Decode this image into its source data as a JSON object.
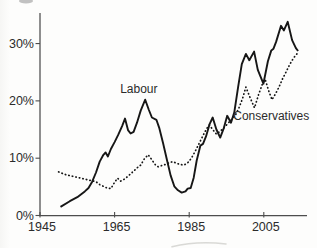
{
  "chart_data": {
    "type": "line",
    "title": "",
    "xlabel": "",
    "ylabel": "",
    "grid": false,
    "legend_position": "inline-labels",
    "x_axis": {
      "min": 1945,
      "max": 2016.5,
      "ticks": [
        {
          "label": "1945",
          "value": 1945
        },
        {
          "label": "1965",
          "value": 1965
        },
        {
          "label": "1985",
          "value": 1985
        },
        {
          "label": "2005",
          "value": 2005
        }
      ]
    },
    "y_axis": {
      "min": 0,
      "max": 35.3,
      "unit": "%",
      "ticks": [
        {
          "label": "0%",
          "value": 0
        },
        {
          "label": "10%",
          "value": 10
        },
        {
          "label": "20%",
          "value": 20
        },
        {
          "label": "30%",
          "value": 30
        }
      ]
    },
    "colors": {
      "line": "#161616",
      "axis": "#4d4d4d",
      "text": "#2b2b2b",
      "background": "#fdfdfc"
    },
    "series": [
      {
        "name": "Labour",
        "line_style": "solid",
        "points": [
          [
            1950.5,
            1.5
          ],
          [
            1953,
            2.5
          ],
          [
            1955,
            3.2
          ],
          [
            1957,
            4.2
          ],
          [
            1958,
            4.8
          ],
          [
            1959,
            5.9
          ],
          [
            1960,
            7.5
          ],
          [
            1961,
            9.4
          ],
          [
            1962,
            10.6
          ],
          [
            1962.6,
            11.0
          ],
          [
            1963.2,
            10.3
          ],
          [
            1964,
            11.6
          ],
          [
            1965,
            12.8
          ],
          [
            1966,
            14.1
          ],
          [
            1967,
            15.6
          ],
          [
            1967.8,
            16.9
          ],
          [
            1968.6,
            14.9
          ],
          [
            1969.3,
            14.3
          ],
          [
            1970.1,
            14.6
          ],
          [
            1971,
            16.2
          ],
          [
            1972,
            18.3
          ],
          [
            1973.2,
            20.2
          ],
          [
            1974.2,
            18.4
          ],
          [
            1975,
            17.1
          ],
          [
            1976.2,
            16.7
          ],
          [
            1977,
            15.2
          ],
          [
            1978,
            12.6
          ],
          [
            1979,
            9.8
          ],
          [
            1980,
            7.0
          ],
          [
            1981,
            5.1
          ],
          [
            1982,
            4.4
          ],
          [
            1983,
            4.0
          ],
          [
            1984,
            4.2
          ],
          [
            1984.6,
            4.7
          ],
          [
            1985.4,
            4.8
          ],
          [
            1986.2,
            6.6
          ],
          [
            1987,
            9.6
          ],
          [
            1988,
            12.2
          ],
          [
            1988.7,
            12.5
          ],
          [
            1989.5,
            13.8
          ],
          [
            1990.5,
            16.0
          ],
          [
            1991.3,
            17.1
          ],
          [
            1992.3,
            15.0
          ],
          [
            1993.3,
            13.6
          ],
          [
            1994.3,
            15.3
          ],
          [
            1995.2,
            17.4
          ],
          [
            1996.2,
            16.2
          ],
          [
            1997.1,
            18.0
          ],
          [
            1998.1,
            22.4
          ],
          [
            1999.1,
            26.4
          ],
          [
            2000.2,
            28.2
          ],
          [
            2001.1,
            27.1
          ],
          [
            2002.4,
            28.6
          ],
          [
            2003.4,
            25.4
          ],
          [
            2004.9,
            23.0
          ],
          [
            2006.1,
            26.9
          ],
          [
            2007,
            28.8
          ],
          [
            2007.6,
            29.1
          ],
          [
            2008.3,
            30.3
          ],
          [
            2009.6,
            33.1
          ],
          [
            2010.4,
            32.3
          ],
          [
            2011.4,
            33.8
          ],
          [
            2012.6,
            30.6
          ],
          [
            2013.6,
            29.2
          ],
          [
            2014.2,
            28.7
          ]
        ]
      },
      {
        "name": "Conservatives",
        "line_style": "dotted",
        "points": [
          [
            1950,
            7.6
          ],
          [
            1952,
            7.1
          ],
          [
            1954,
            6.8
          ],
          [
            1956,
            6.5
          ],
          [
            1958,
            6.2
          ],
          [
            1960,
            5.9
          ],
          [
            1961,
            5.4
          ],
          [
            1962,
            5.1
          ],
          [
            1963,
            4.8
          ],
          [
            1964,
            4.7
          ],
          [
            1965,
            5.8
          ],
          [
            1965.8,
            6.5
          ],
          [
            1966.6,
            6.0
          ],
          [
            1967.5,
            6.3
          ],
          [
            1968.5,
            6.8
          ],
          [
            1970,
            7.7
          ],
          [
            1971,
            8.3
          ],
          [
            1972,
            8.8
          ],
          [
            1973,
            9.9
          ],
          [
            1974,
            10.6
          ],
          [
            1975,
            9.7
          ],
          [
            1976,
            8.8
          ],
          [
            1976.7,
            8.5
          ],
          [
            1977.6,
            8.7
          ],
          [
            1978.6,
            8.9
          ],
          [
            1979.6,
            9.2
          ],
          [
            1980.6,
            9.4
          ],
          [
            1981.6,
            9.1
          ],
          [
            1982.6,
            8.9
          ],
          [
            1983.6,
            8.8
          ],
          [
            1984.6,
            9.2
          ],
          [
            1985.6,
            10.0
          ],
          [
            1986.6,
            11.2
          ],
          [
            1987.6,
            12.5
          ],
          [
            1988.6,
            13.8
          ],
          [
            1989.6,
            15.1
          ],
          [
            1990.4,
            15.8
          ],
          [
            1991.3,
            15.0
          ],
          [
            1992.3,
            14.2
          ],
          [
            1993.3,
            14.7
          ],
          [
            1994.3,
            15.3
          ],
          [
            1995.3,
            16.0
          ],
          [
            1996.3,
            16.7
          ],
          [
            1997.3,
            17.4
          ],
          [
            1998.3,
            18.7
          ],
          [
            1999.3,
            20.4
          ],
          [
            2000.2,
            22.4
          ],
          [
            2001.3,
            20.6
          ],
          [
            2002.5,
            18.8
          ],
          [
            2003.6,
            21.1
          ],
          [
            2004.7,
            23.1
          ],
          [
            2005.4,
            23.7
          ],
          [
            2006.3,
            21.8
          ],
          [
            2007.2,
            20.2
          ],
          [
            2008.1,
            21.2
          ],
          [
            2009,
            22.3
          ],
          [
            2010,
            23.8
          ],
          [
            2011,
            25.1
          ],
          [
            2012,
            26.4
          ],
          [
            2013,
            27.5
          ],
          [
            2014,
            28.3
          ]
        ]
      }
    ],
    "annotations": [
      {
        "text": "Labour",
        "series": "Labour",
        "year": 1971.5,
        "value": 22.0
      },
      {
        "text": "Conservatives",
        "series": "Conservatives",
        "year": 2007.0,
        "value": 17.3
      }
    ]
  }
}
